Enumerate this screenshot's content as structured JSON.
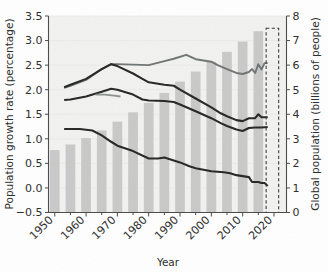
{
  "chart_data": {
    "type": "line",
    "title": "",
    "subtitle": "",
    "xlabel": "Year",
    "ylabel": "Population growth rate (percentage)",
    "y2label": "Global population (billions of people)",
    "xlim": [
      1948,
      2024
    ],
    "ylim": [
      -0.5,
      3.5
    ],
    "y2lim": [
      0,
      8
    ],
    "grid": false,
    "legend": "none",
    "x_ticks": [
      "1950",
      "1960",
      "1970",
      "1980",
      "1990",
      "2000",
      "2010",
      "2020"
    ],
    "x_tick_values": [
      1950,
      1960,
      1970,
      1980,
      1990,
      2000,
      2010,
      2020
    ],
    "y_ticks": [
      "-0.5",
      "0.0",
      "0.5",
      "1.0",
      "1.5",
      "2.0",
      "2.5",
      "3.0",
      "3.5"
    ],
    "y_tick_values": [
      -0.5,
      0.0,
      0.5,
      1.0,
      1.5,
      2.0,
      2.5,
      3.0,
      3.5
    ],
    "y2_ticks": [
      "0",
      "1",
      "2",
      "3",
      "4",
      "5",
      "6",
      "7",
      "8"
    ],
    "y2_tick_values": [
      0,
      1,
      2,
      3,
      4,
      5,
      6,
      7,
      8
    ],
    "bars": {
      "name": "Global population",
      "color": "#c9c9c9",
      "axis": "right",
      "unit": "billions of people",
      "x": [
        1950,
        1955,
        1960,
        1965,
        1970,
        1975,
        1980,
        1985,
        1990,
        1995,
        2000,
        2005,
        2010,
        2015
      ],
      "values": [
        2.54,
        2.77,
        3.03,
        3.34,
        3.7,
        4.08,
        4.46,
        4.87,
        5.33,
        5.74,
        6.14,
        6.54,
        6.96,
        7.38
      ]
    },
    "series": [
      {
        "name": "upper-gray-line",
        "color": "#6e7574",
        "axis": "left",
        "unit": "percentage",
        "x": [
          1953,
          1955,
          1960,
          1965,
          1968,
          1970,
          1975,
          1980,
          1985,
          1988,
          1992,
          1995,
          2000,
          2002,
          2005,
          2008,
          2010,
          2012,
          2013,
          2014,
          2015,
          2016,
          2017,
          2018
        ],
        "values": [
          2.04,
          2.08,
          2.2,
          2.42,
          2.52,
          2.52,
          2.51,
          2.5,
          2.58,
          2.63,
          2.71,
          2.62,
          2.57,
          2.5,
          2.42,
          2.34,
          2.32,
          2.36,
          2.42,
          2.34,
          2.52,
          2.41,
          2.54,
          2.54
        ]
      },
      {
        "name": "upper-dark-line",
        "color": "#262626",
        "axis": "left",
        "unit": "percentage",
        "x": [
          1953,
          1955,
          1960,
          1965,
          1968,
          1970,
          1975,
          1978,
          1980,
          1985,
          1988,
          1990,
          1995,
          2000,
          2003,
          2005,
          2008,
          2010,
          2012,
          2014,
          2015,
          2016,
          2018
        ],
        "values": [
          2.05,
          2.1,
          2.22,
          2.42,
          2.52,
          2.48,
          2.33,
          2.22,
          2.15,
          2.1,
          2.08,
          2.0,
          1.82,
          1.64,
          1.52,
          1.46,
          1.38,
          1.36,
          1.42,
          1.42,
          1.5,
          1.44,
          1.44
        ]
      },
      {
        "name": "middle-dark-line",
        "color": "#262626",
        "axis": "left",
        "unit": "percentage",
        "x": [
          1953,
          1955,
          1960,
          1965,
          1968,
          1970,
          1975,
          1978,
          1980,
          1985,
          1988,
          1990,
          1995,
          2000,
          2003,
          2005,
          2008,
          2010,
          2012,
          2014,
          2016,
          2018
        ],
        "values": [
          1.79,
          1.8,
          1.86,
          1.96,
          2.02,
          2.0,
          1.9,
          1.8,
          1.78,
          1.77,
          1.75,
          1.7,
          1.56,
          1.42,
          1.32,
          1.26,
          1.19,
          1.16,
          1.22,
          1.23,
          1.23,
          1.24
        ]
      },
      {
        "name": "short-gray-segment",
        "color": "#8c918f",
        "axis": "left",
        "unit": "percentage",
        "x": [
          1963,
          1966,
          1969,
          1971
        ],
        "values": [
          1.9,
          1.9,
          1.88,
          1.86
        ]
      },
      {
        "name": "lower-dark-line",
        "color": "#262626",
        "axis": "left",
        "unit": "percentage",
        "x": [
          1953,
          1958,
          1962,
          1965,
          1968,
          1970,
          1975,
          1980,
          1983,
          1985,
          1990,
          1993,
          1995,
          2000,
          2004,
          2006,
          2008,
          2010,
          2012,
          2013,
          2015,
          2016,
          2017,
          2018
        ],
        "values": [
          1.2,
          1.2,
          1.17,
          1.07,
          0.94,
          0.86,
          0.75,
          0.6,
          0.6,
          0.62,
          0.52,
          0.44,
          0.4,
          0.34,
          0.32,
          0.3,
          0.26,
          0.24,
          0.22,
          0.12,
          0.12,
          0.1,
          0.1,
          0.04
        ]
      }
    ],
    "annotations": [
      {
        "name": "projection-box",
        "kind": "dashed-rectangle",
        "x_range": [
          2017.5,
          2021.5
        ],
        "y2_range": [
          0,
          7.5
        ]
      }
    ]
  }
}
